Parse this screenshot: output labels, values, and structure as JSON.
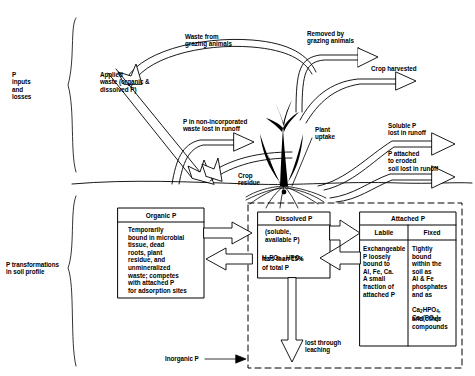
{
  "diagram": {
    "braces": {
      "inputs_label": "P\ninputs\nand\nlosses",
      "transform_label": "P transformations\nin soil profile"
    },
    "flow_labels": {
      "waste_from_grazing": "Waste from\ngrazing animals",
      "removed_by_grazing": "Removed by\ngrazing animals",
      "crop_harvested": "Crop harvested",
      "applied_waste": "Applied\nwaste (organic &\ndissolved P)",
      "non_incorporated": "P in non-incorporated\nwaste lost in runoff",
      "crop_residue": "Crop\nresidue",
      "plant_uptake": "Plant\nuptake",
      "soluble_runoff": "Soluble P\nlost in runoff",
      "eroded_runoff": "P attached\nto eroded\nsoil lost in runoff",
      "leaching": "lost through\nleaching",
      "inorganic_p": "Inorganic P"
    },
    "boxes": {
      "organic_p": {
        "header": "Organic P",
        "body": "Temporarily\nbound in microbial\ntissue, dead\nroots, plant\nresidue, and\nunmineralized\nwaste; competes\nwith attached P\nfor adsorption sites"
      },
      "dissolved_p": {
        "header": "Dissolved P",
        "line1": "(soluble,",
        "line2": "available P)",
        "formula_prefix": "H",
        "formula_sub1": "2",
        "formula_mid": "PO",
        "formula_sub2": "4",
        "formula_sep": " , HPO",
        "formula_sub3": "4",
        "line4": "less than 15%",
        "line5": "of total P"
      },
      "attached_p": {
        "header": "Attached P",
        "labile": {
          "header": "Labile",
          "body": "Exchangeable\nP loosely\nbound to\nAl, Fe, Ca.\nA small\nfraction of\nattached P"
        },
        "fixed": {
          "header": "Fixed",
          "body_a": "Tightly\nbound\nwithin the\nsoil as\nAl & Fe\nphosphates\nand as",
          "formula_a_1": "Ca",
          "formula_a_sub": "2",
          "formula_a_2": "HPO",
          "formula_a_sub2": "4",
          "formula_b_1": "Ca",
          "formula_b_sub": "5",
          "formula_b_2": "(PO",
          "formula_b_sub2": "4",
          "formula_b_3": ")",
          "formula_b_sub3": "3",
          "body_b": "and other\ncompounds"
        }
      }
    },
    "colors": {
      "ink": "#000000",
      "paper": "#ffffff"
    }
  }
}
